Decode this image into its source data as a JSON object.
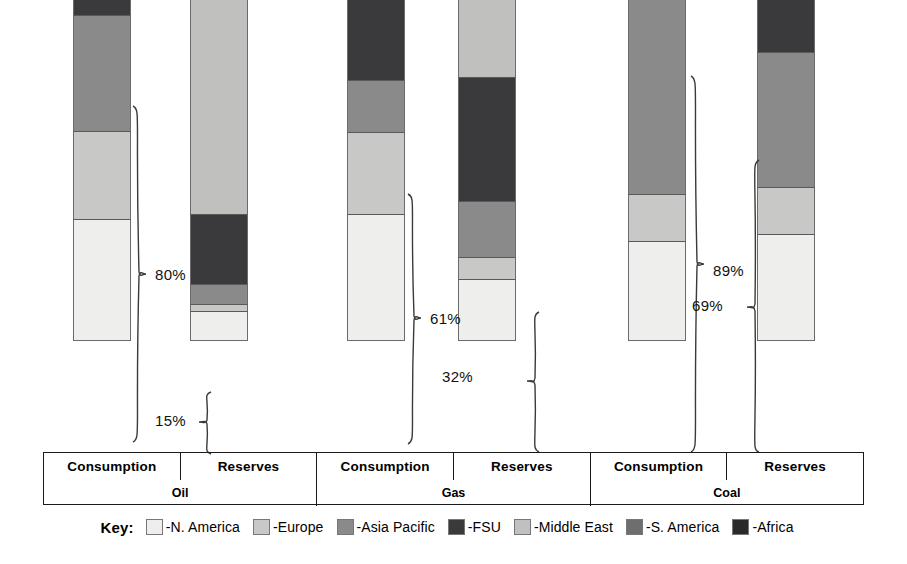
{
  "chart_data": {
    "type": "bar",
    "subtype": "stacked-bar-100pct",
    "title": "",
    "xlabel": "",
    "ylabel": "",
    "ylim": [
      0,
      100
    ],
    "grid": false,
    "legend_position": "bottom",
    "orientation": "vertical",
    "categories": [
      "Oil Consumption",
      "Oil Reserves",
      "Gas Consumption",
      "Gas Reserves",
      "Coal Consumption",
      "Coal Reserves"
    ],
    "groups": [
      {
        "name": "Oil",
        "columns": [
          "Consumption",
          "Reserves"
        ]
      },
      {
        "name": "Gas",
        "columns": [
          "Consumption",
          "Reserves"
        ]
      },
      {
        "name": "Coal",
        "columns": [
          "Consumption",
          "Reserves"
        ]
      }
    ],
    "series": [
      {
        "name": "-N. America",
        "color": "#eeeeec",
        "values": [
          28.4,
          7.0,
          29.6,
          14.4,
          23.2,
          24.9
        ]
      },
      {
        "name": "-Europe",
        "color": "#c8c8c6",
        "values": [
          20.5,
          1.6,
          19.1,
          5.1,
          10.9,
          10.9
        ]
      },
      {
        "name": "-Asia Pacific",
        "color": "#8a8a8a",
        "values": [
          27.0,
          4.7,
          11.9,
          13.0,
          52.8,
          31.4
        ]
      },
      {
        "name": "-FSU",
        "color": "#3a3a3c",
        "values": [
          5.3,
          16.3,
          24.2,
          28.8,
          7.7,
          22.1
        ]
      },
      {
        "name": "-Middle East",
        "color": "#c0c0be",
        "values": [
          5.1,
          57.3,
          9.3,
          25.6,
          1.2,
          0.0
        ]
      },
      {
        "name": "-S. America",
        "color": "#6e6e70",
        "values": [
          9.5,
          8.1,
          2.6,
          6.5,
          0.4,
          1.4
        ]
      },
      {
        "name": "-Africa",
        "color": "#2a2a2c",
        "values": [
          4.2,
          5.0,
          3.3,
          6.5,
          3.7,
          9.3
        ]
      }
    ],
    "annotations": [
      {
        "id": "oil-consumption-80",
        "label": "80%",
        "applies_to": "Oil Consumption",
        "note": "N. America + Europe + Asia Pacific share of consumption"
      },
      {
        "id": "oil-reserves-15",
        "label": "15%",
        "applies_to": "Oil Reserves",
        "note": "N. America + Europe + Asia Pacific share of reserves"
      },
      {
        "id": "gas-consumption-61",
        "label": "61%",
        "applies_to": "Gas Consumption",
        "note": "N. America + Europe + Asia Pacific share of consumption"
      },
      {
        "id": "gas-reserves-32",
        "label": "32%",
        "applies_to": "Gas Reserves",
        "note": "N. America + Europe + Asia Pacific share of reserves"
      },
      {
        "id": "coal-consumption-89",
        "label": "89%",
        "applies_to": "Coal Consumption",
        "note": "N. America + Europe + Asia Pacific share of consumption"
      },
      {
        "id": "coal-reserves-69",
        "label": "69%",
        "applies_to": "Coal Reserves",
        "note": "N. America + Europe + Asia Pacific share of reserves"
      }
    ]
  },
  "axis": {
    "columns": [
      {
        "label": "Consumption"
      },
      {
        "label": "Reserves"
      },
      {
        "label": "Consumption"
      },
      {
        "label": "Reserves"
      },
      {
        "label": "Consumption"
      },
      {
        "label": "Reserves"
      }
    ],
    "groups": [
      {
        "label": "Oil"
      },
      {
        "label": "Gas"
      },
      {
        "label": "Coal"
      }
    ]
  },
  "legend": {
    "title": "Key:",
    "items": [
      {
        "label": "-N. America",
        "color": "#eeeeec"
      },
      {
        "label": "-Europe",
        "color": "#c8c8c6"
      },
      {
        "label": "-Asia Pacific",
        "color": "#8a8a8a"
      },
      {
        "label": "-FSU",
        "color": "#3a3a3c"
      },
      {
        "label": "-Middle East",
        "color": "#c0c0be"
      },
      {
        "label": "-S. America",
        "color": "#6e6e70"
      },
      {
        "label": "-Africa",
        "color": "#2a2a2c"
      }
    ]
  },
  "annotation_labels": {
    "a0": "80%",
    "a1": "15%",
    "a2": "61%",
    "a3": "32%",
    "a4": "89%",
    "a5": "69%"
  }
}
